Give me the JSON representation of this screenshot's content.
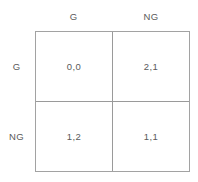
{
  "matrix": {
    "column_headers": [
      "G",
      "NG"
    ],
    "row_headers": [
      "G",
      "NG"
    ],
    "cells": [
      [
        {
          "value": "0,0"
        },
        {
          "value": "2,1"
        }
      ],
      [
        {
          "value": "1,2"
        },
        {
          "value": "1,1"
        }
      ]
    ],
    "colors": {
      "border": "#a2a2a2",
      "divider": "#9a9a9a",
      "text": "#5a5a5a",
      "background": "#ffffff"
    }
  }
}
